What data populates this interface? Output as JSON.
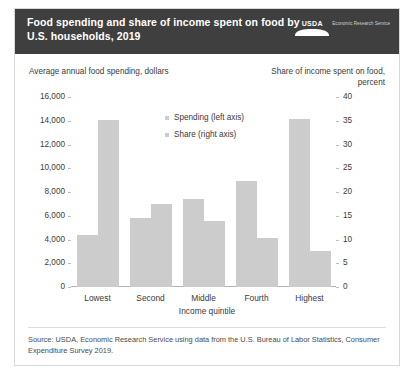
{
  "header": {
    "title": "Food spending and share of income spent on food by U.S. households, 2019",
    "logo_word": "USDA",
    "logo_sub": "Economic Research Service",
    "logo_icon": "usda-logo-icon",
    "background_color": "#3f3f3f"
  },
  "source_note": "Source: USDA, Economic Research Service using data from the U.S. Bureau of Labor Statistics, Consumer Expenditure Survey 2019.",
  "chart_data": {
    "type": "bar",
    "title": "Food spending and share of income spent on food by U.S. households, 2019",
    "categories": [
      "Lowest",
      "Second",
      "Middle",
      "Fourth",
      "Highest"
    ],
    "xlabel": "Income quintile",
    "ylabel": "Average annual food spending, dollars",
    "y2label": "Share of income spent on food, percent",
    "ylim": [
      0,
      16000
    ],
    "y2lim": [
      0,
      40
    ],
    "yticks": [
      "0",
      "2,000",
      "4,000",
      "6,000",
      "8,000",
      "10,000",
      "12,000",
      "14,000",
      "16,000"
    ],
    "y2ticks": [
      "0",
      "5",
      "10",
      "15",
      "20",
      "25",
      "30",
      "35",
      "40"
    ],
    "grid": false,
    "legend_position": "inside-top-center",
    "bar_color": "#cccccc",
    "series": [
      {
        "name": "Spending (left axis)",
        "axis": "left",
        "values": [
          4400,
          5800,
          7400,
          8950,
          14150
        ]
      },
      {
        "name": "Share (right axis)",
        "axis": "right",
        "values": [
          35.1,
          17.5,
          13.8,
          10.3,
          7.5
        ]
      }
    ]
  }
}
